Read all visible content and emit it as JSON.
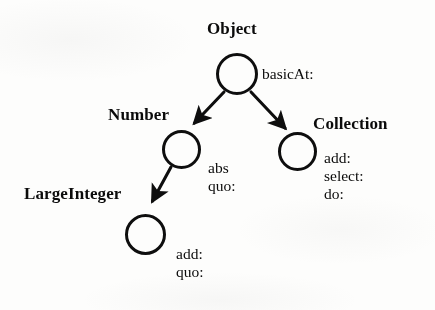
{
  "figure": {
    "kind": "class-hierarchy-diagram",
    "ink_color": "#101010",
    "background_color": "#fbfbfa"
  },
  "nodes": [
    {
      "id": "object",
      "label": "Object",
      "methods": [
        "basicAt:"
      ],
      "circle": {
        "cx": 237,
        "cy": 74,
        "r": 21
      },
      "label_pos": {
        "x": 207,
        "y": 19
      },
      "methods_pos": {
        "x": 262,
        "y": 65
      }
    },
    {
      "id": "number",
      "label": "Number",
      "methods": [
        "abs",
        "quo:"
      ],
      "circle": {
        "cx": 181,
        "cy": 149,
        "r": 19.5
      },
      "label_pos": {
        "x": 108,
        "y": 105
      },
      "methods_pos": {
        "x": 208,
        "y": 159
      }
    },
    {
      "id": "collection",
      "label": "Collection",
      "methods": [
        "add:",
        "select:",
        "do:"
      ],
      "circle": {
        "cx": 297,
        "cy": 151.5,
        "r": 19.5
      },
      "label_pos": {
        "x": 313,
        "y": 114
      },
      "methods_pos": {
        "x": 324,
        "y": 149
      }
    },
    {
      "id": "largeinteger",
      "label": "LargeInteger",
      "methods": [
        "add:",
        "quo:"
      ],
      "circle": {
        "cx": 145.5,
        "cy": 234,
        "r": 20.5
      },
      "label_pos": {
        "x": 24,
        "y": 184
      },
      "methods_pos": {
        "x": 176,
        "y": 245
      }
    }
  ],
  "edges": [
    {
      "id": "object-to-number",
      "from": "object",
      "to": "number",
      "from_point": {
        "x": 224,
        "y": 92
      },
      "to_point": {
        "x": 194,
        "y": 124
      }
    },
    {
      "id": "object-to-collection",
      "from": "object",
      "to": "collection",
      "from_point": {
        "x": 251,
        "y": 92
      },
      "to_point": {
        "x": 285,
        "y": 129
      }
    },
    {
      "id": "number-to-largeinteger",
      "from": "number",
      "to": "largeinteger",
      "from_point": {
        "x": 171,
        "y": 167
      },
      "to_point": {
        "x": 152,
        "y": 202
      }
    }
  ]
}
